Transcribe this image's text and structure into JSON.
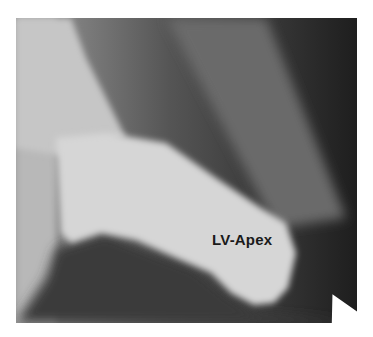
{
  "figure": {
    "type": "ventriculogram",
    "label": "LV-Apex",
    "colors": {
      "background": "#ffffff",
      "ventricle": "#d2d2d2",
      "soft_tissue": "#6e6e6e",
      "dark_region": "#2a2a2a",
      "arrow": "#ffffff",
      "label_text": "#1a1a1a"
    },
    "arrows": [
      {
        "name": "arrow-1",
        "x": 250,
        "y": 155,
        "angle": 125
      },
      {
        "name": "arrow-2",
        "x": 282,
        "y": 190,
        "angle": 145
      },
      {
        "name": "arrow-3",
        "x": 295,
        "y": 248,
        "angle": 180
      },
      {
        "name": "arrow-4",
        "x": 290,
        "y": 283,
        "angle": 205
      },
      {
        "name": "arrow-5",
        "x": 178,
        "y": 283,
        "angle": -30
      }
    ]
  }
}
